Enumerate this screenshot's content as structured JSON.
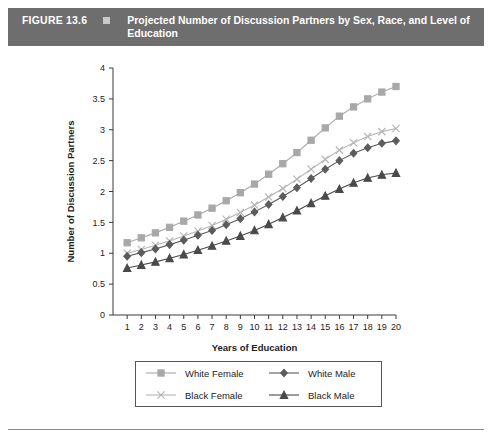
{
  "header": {
    "figure_number": "FIGURE 13.6",
    "bullet_icon": "square-bullet-icon",
    "title": "Projected Number of Discussion Partners by Sex, Race, and Level of Education",
    "bar_color": "#6e6e6e",
    "text_color": "#ffffff"
  },
  "chart_data": {
    "type": "line",
    "title": "Projected Number of Discussion Partners by Sex, Race, and Level of Education",
    "xlabel": "Years of Education",
    "ylabel": "Number of Discussion Partners",
    "x": [
      1,
      2,
      3,
      4,
      5,
      6,
      7,
      8,
      9,
      10,
      11,
      12,
      13,
      14,
      15,
      16,
      17,
      18,
      19,
      20
    ],
    "xlim": [
      0,
      20
    ],
    "ylim": [
      0,
      4
    ],
    "xticks": [
      1,
      2,
      3,
      4,
      5,
      6,
      7,
      8,
      9,
      10,
      11,
      12,
      13,
      14,
      15,
      16,
      17,
      18,
      19,
      20
    ],
    "yticks": [
      0,
      0.5,
      1,
      1.5,
      2,
      2.5,
      3,
      3.5,
      4
    ],
    "ytick_labels": [
      "0",
      "0.5",
      "1",
      "1.5",
      "2",
      "2.5",
      "3",
      "3.5",
      "4"
    ],
    "grid": false,
    "legend_position": "below",
    "series": [
      {
        "name": "White Female",
        "marker": "square",
        "color": "#a8a8a8",
        "values": [
          1.17,
          1.25,
          1.33,
          1.42,
          1.52,
          1.62,
          1.73,
          1.85,
          1.98,
          2.12,
          2.28,
          2.45,
          2.63,
          2.83,
          3.03,
          3.22,
          3.37,
          3.5,
          3.61,
          3.7
        ]
      },
      {
        "name": "Black Female",
        "marker": "cross",
        "color": "#b5b5b5",
        "values": [
          1.0,
          1.06,
          1.13,
          1.2,
          1.28,
          1.36,
          1.45,
          1.55,
          1.66,
          1.78,
          1.91,
          2.05,
          2.2,
          2.36,
          2.52,
          2.67,
          2.79,
          2.89,
          2.97,
          3.02
        ]
      },
      {
        "name": "White Male",
        "marker": "diamond",
        "color": "#5c5c5c",
        "values": [
          0.95,
          1.01,
          1.07,
          1.14,
          1.21,
          1.29,
          1.37,
          1.46,
          1.56,
          1.67,
          1.79,
          1.92,
          2.06,
          2.21,
          2.36,
          2.5,
          2.62,
          2.71,
          2.78,
          2.82
        ]
      },
      {
        "name": "Black Male",
        "marker": "triangle",
        "color": "#4a4a4a",
        "values": [
          0.76,
          0.81,
          0.86,
          0.92,
          0.98,
          1.05,
          1.12,
          1.2,
          1.28,
          1.37,
          1.47,
          1.58,
          1.69,
          1.81,
          1.93,
          2.04,
          2.14,
          2.22,
          2.27,
          2.3
        ]
      }
    ]
  },
  "legend": {
    "entries": [
      {
        "label": "White Female",
        "marker": "square",
        "color": "#a8a8a8"
      },
      {
        "label": "White Male",
        "marker": "diamond",
        "color": "#5c5c5c"
      },
      {
        "label": "Black Female",
        "marker": "cross",
        "color": "#b5b5b5"
      },
      {
        "label": "Black Male",
        "marker": "triangle",
        "color": "#4a4a4a"
      }
    ]
  }
}
